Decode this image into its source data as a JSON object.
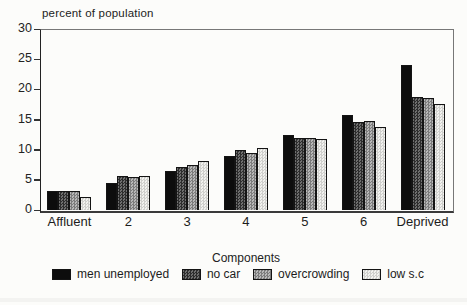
{
  "chart_data": {
    "type": "bar",
    "title": "",
    "y_axis_title": "percent of population",
    "xlabel": "Components",
    "ylabel": "percent of population",
    "categories": [
      "Affluent",
      "2",
      "3",
      "4",
      "5",
      "6",
      "Deprived"
    ],
    "series": [
      {
        "name": "men unemployed",
        "values": [
          3.2,
          4.5,
          6.4,
          9.0,
          12.4,
          15.8,
          24.1
        ]
      },
      {
        "name": "no car",
        "values": [
          3.2,
          5.7,
          7.2,
          9.9,
          11.9,
          14.6,
          18.7
        ]
      },
      {
        "name": "overcrowding",
        "values": [
          3.1,
          5.5,
          7.5,
          9.5,
          11.9,
          14.7,
          18.6
        ]
      },
      {
        "name": "low s.c",
        "values": [
          2.2,
          5.6,
          8.2,
          10.2,
          11.7,
          13.8,
          17.5
        ]
      }
    ],
    "series_styles": [
      {
        "pattern": "solid",
        "fill": "#0d0d0d"
      },
      {
        "pattern": "checker-dark",
        "fill": "#4a4a4a"
      },
      {
        "pattern": "checker-medium",
        "fill": "#9a9a9a"
      },
      {
        "pattern": "checker-light",
        "fill": "#e0e0dd"
      }
    ],
    "ylim": [
      0,
      30
    ],
    "yticks": [
      0,
      5,
      10,
      15,
      20,
      25,
      30
    ],
    "grid": false,
    "legend_position": "bottom"
  },
  "colors": {
    "background": "#fcfcfa",
    "axis": "#222222",
    "text": "#1c1c1c"
  }
}
